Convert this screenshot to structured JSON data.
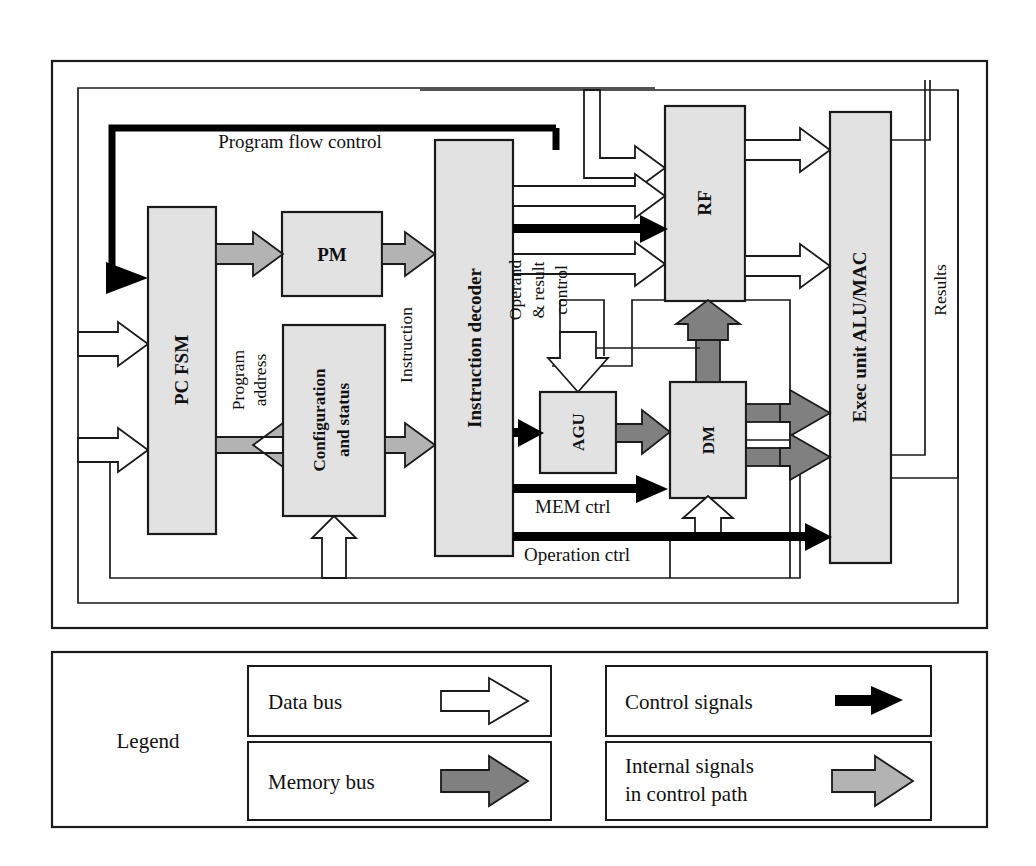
{
  "figure": {
    "type": "block-diagram",
    "colors": {
      "block_fill": "#e2e2e2",
      "stroke": "#1a1a1a",
      "data_bus": "#ffffff",
      "memory_bus": "#808080",
      "control_signal": "#000000",
      "internal_signal": "#b3b3b3",
      "background": "#ffffff"
    }
  },
  "blocks": [
    {
      "id": "pc_fsm",
      "label": "PC FSM",
      "orientation": "vertical"
    },
    {
      "id": "pm",
      "label": "PM",
      "orientation": "horizontal"
    },
    {
      "id": "config",
      "label": "Configuration\nand status",
      "line1": "Configuration",
      "line2": "and status",
      "orientation": "vertical"
    },
    {
      "id": "instr_decoder",
      "label": "Instruction decoder",
      "orientation": "vertical"
    },
    {
      "id": "rf",
      "label": "RF",
      "orientation": "vertical"
    },
    {
      "id": "agu",
      "label": "AGU",
      "orientation": "vertical"
    },
    {
      "id": "dm",
      "label": "DM",
      "orientation": "vertical"
    },
    {
      "id": "exec",
      "label": "Exec unit ALU/MAC",
      "orientation": "vertical"
    }
  ],
  "signal_labels": [
    {
      "id": "program_flow_control",
      "text": "Program flow control",
      "orientation": "horizontal",
      "bus": "control"
    },
    {
      "id": "program_address",
      "line1": "Program",
      "line2": "address",
      "orientation": "vertical",
      "bus": "internal"
    },
    {
      "id": "instruction",
      "text": "Instruction",
      "orientation": "vertical",
      "bus": "internal"
    },
    {
      "id": "operand_result_ctrl",
      "line1": "Operand",
      "line2": "& result",
      "line3": "control",
      "orientation": "vertical",
      "bus": "control"
    },
    {
      "id": "mem_ctrl",
      "text": "MEM ctrl",
      "orientation": "horizontal",
      "bus": "control"
    },
    {
      "id": "operation_ctrl",
      "text": "Operation ctrl",
      "orientation": "horizontal",
      "bus": "control"
    },
    {
      "id": "results",
      "text": "Results",
      "orientation": "vertical",
      "bus": "data"
    }
  ],
  "legend": {
    "title": "Legend",
    "entries": [
      {
        "id": "data-bus",
        "label": "Data bus",
        "arrow": "hollow",
        "color": "#ffffff"
      },
      {
        "id": "control-signals",
        "label": "Control signals",
        "arrow": "solid",
        "color": "#000000"
      },
      {
        "id": "memory-bus",
        "label": "Memory bus",
        "arrow": "dark-gray",
        "color": "#808080"
      },
      {
        "id": "internal-signals",
        "label_line1": "Internal signals",
        "label_line2": "in control path",
        "arrow": "light-gray",
        "color": "#b3b3b3"
      }
    ]
  }
}
